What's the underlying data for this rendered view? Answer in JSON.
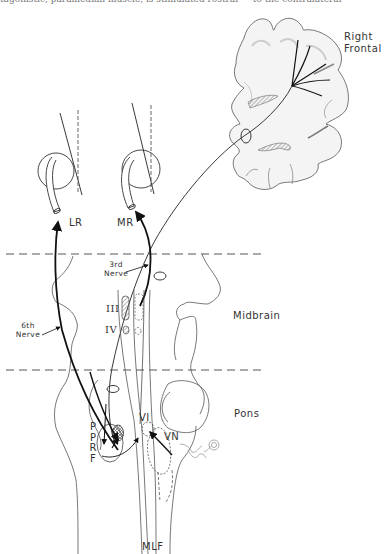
{
  "header": {
    "cropped_text": "tagonistic, paramedian muscle, is stimulated rostral — to the contralateral"
  },
  "diagram": {
    "regions": {
      "right_frontal_line1": "Right",
      "right_frontal_line2": "Frontal",
      "midbrain": "Midbrain",
      "pons": "Pons"
    },
    "muscles": {
      "lateral_rectus": "LR",
      "medial_rectus": "MR"
    },
    "nerves": {
      "third_line1": "3rd",
      "third_line2": "Nerve",
      "sixth_line1": "6th",
      "sixth_line2": "Nerve"
    },
    "nuclei": {
      "oculomotor": "III",
      "trochlear": "IV",
      "abducens": "VI",
      "vestibular": "VN",
      "pprf_letters": [
        "P",
        "P",
        "R",
        "F"
      ],
      "mlf": "MLF"
    },
    "colors": {
      "line": "#222222",
      "outline": "#555555",
      "shading": "#e6e6e6",
      "hatch": "#888888"
    }
  }
}
